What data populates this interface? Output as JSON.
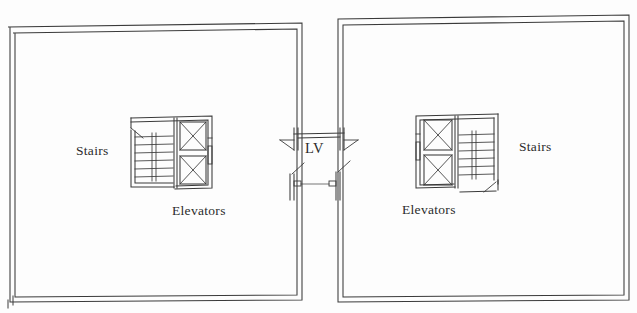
{
  "document": {
    "type": "architectural-floor-plan",
    "description": "Paired building floor plan with central link",
    "background_color": "#fdfdfd",
    "line_color": "#3a3a3a",
    "text_color": "#2b2b2b",
    "width": 637,
    "height": 313
  },
  "labels": {
    "stairs_left": "Stairs",
    "stairs_right": "Stairs",
    "elevators_left": "Elevators",
    "elevators_right": "Elevators",
    "link": "LV"
  },
  "buildings": [
    {
      "id": "left-building",
      "name": "Left Building",
      "outline": {
        "outer": {
          "x": 8,
          "y": 24,
          "width": 294,
          "height": 278
        },
        "inner": {
          "x": 13,
          "y": 30,
          "width": 284,
          "height": 268
        },
        "wall_thickness": 5
      },
      "core": {
        "name": "left-service-core",
        "x": 129,
        "y": 114,
        "width": 84,
        "height": 76,
        "stairs": {
          "x": 132,
          "y": 130,
          "width": 42,
          "height": 56,
          "tread_count": 6,
          "stringer": true,
          "door_swing": "top-left"
        },
        "elevators": {
          "count": 2,
          "cab_width": 30,
          "cab_height": 30,
          "cabs": [
            {
              "x": 178,
              "y": 122
            },
            {
              "x": 178,
              "y": 157
            }
          ],
          "lobby_door": true
        }
      }
    },
    {
      "id": "right-building",
      "name": "Right Building",
      "outline": {
        "outer": {
          "x": 336,
          "y": 15,
          "width": 293,
          "height": 287
        },
        "inner": {
          "x": 341,
          "y": 21,
          "width": 283,
          "height": 277
        },
        "wall_thickness": 5
      },
      "core": {
        "name": "right-service-core",
        "x": 414,
        "y": 112,
        "width": 84,
        "height": 76,
        "stairs": {
          "x": 460,
          "y": 128,
          "width": 42,
          "height": 56,
          "tread_count": 6,
          "stringer": true,
          "door_swing": "bottom-right"
        },
        "elevators": {
          "count": 2,
          "cab_width": 30,
          "cab_height": 30,
          "cabs": [
            {
              "x": 424,
              "y": 120
            },
            {
              "x": 424,
              "y": 155
            }
          ],
          "lobby_door": true
        }
      }
    }
  ],
  "link": {
    "id": "central-link",
    "name": "LV link corridor",
    "label": "LV",
    "upper": {
      "left_wall_x": 294,
      "right_wall_x": 344,
      "top_y": 127,
      "bottom_y": 152,
      "door_swings": 2
    },
    "lower": {
      "left_wall_x": 290,
      "right_wall_x": 340,
      "top_y": 168,
      "bottom_y": 200,
      "door_swings": 2,
      "threshold_line": true
    }
  }
}
